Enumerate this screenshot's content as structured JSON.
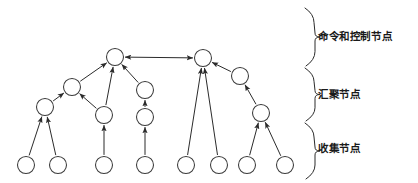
{
  "figure": {
    "title": "",
    "background_color": "#ffffff",
    "stroke_color": "#2b2b2b",
    "node_fill": "#ffffff",
    "width": 418,
    "height": 183
  },
  "tiers": [
    {
      "id": "command-control",
      "label": "命令和控制节点",
      "brace_top": 8,
      "brace_bottom": 66
    },
    {
      "id": "aggregation",
      "label": "汇聚节点",
      "brace_top": 68,
      "brace_bottom": 121
    },
    {
      "id": "collection",
      "label": "收集节点",
      "brace_top": 123,
      "brace_bottom": 179
    }
  ],
  "graph": {
    "node_radius": 8.5,
    "nodes": [
      {
        "id": "c1",
        "tier": "command-control",
        "x": 115,
        "y": 57
      },
      {
        "id": "c2",
        "tier": "command-control",
        "x": 203,
        "y": 58
      },
      {
        "id": "a1",
        "tier": "aggregation",
        "x": 72,
        "y": 87
      },
      {
        "id": "a2",
        "tier": "aggregation",
        "x": 145,
        "y": 90
      },
      {
        "id": "a3",
        "tier": "aggregation",
        "x": 240,
        "y": 76
      },
      {
        "id": "a4",
        "tier": "aggregation",
        "x": 45,
        "y": 107
      },
      {
        "id": "a5",
        "tier": "aggregation",
        "x": 104,
        "y": 115
      },
      {
        "id": "a6",
        "tier": "aggregation",
        "x": 145,
        "y": 117
      },
      {
        "id": "a7",
        "tier": "aggregation",
        "x": 261,
        "y": 113
      },
      {
        "id": "s1",
        "tier": "collection",
        "x": 26,
        "y": 165
      },
      {
        "id": "s2",
        "tier": "collection",
        "x": 58,
        "y": 165
      },
      {
        "id": "s3",
        "tier": "collection",
        "x": 104,
        "y": 165
      },
      {
        "id": "s4",
        "tier": "collection",
        "x": 145,
        "y": 165
      },
      {
        "id": "s5",
        "tier": "collection",
        "x": 186,
        "y": 165
      },
      {
        "id": "s6",
        "tier": "collection",
        "x": 219,
        "y": 165
      },
      {
        "id": "s7",
        "tier": "collection",
        "x": 247,
        "y": 165
      },
      {
        "id": "s8",
        "tier": "collection",
        "x": 285,
        "y": 165
      }
    ],
    "edges": [
      {
        "from": "c1",
        "to": "c2",
        "direction": "bidirectional"
      },
      {
        "from": "a1",
        "to": "c1",
        "direction": "forward"
      },
      {
        "from": "a5",
        "to": "c1",
        "direction": "forward"
      },
      {
        "from": "a2",
        "to": "c1",
        "direction": "forward"
      },
      {
        "from": "a4",
        "to": "a1",
        "direction": "forward"
      },
      {
        "from": "a5",
        "to": "a1",
        "direction": "forward"
      },
      {
        "from": "s1",
        "to": "a4",
        "direction": "forward"
      },
      {
        "from": "s2",
        "to": "a4",
        "direction": "forward"
      },
      {
        "from": "s3",
        "to": "a5",
        "direction": "forward"
      },
      {
        "from": "a6",
        "to": "a2",
        "direction": "forward"
      },
      {
        "from": "s4",
        "to": "a6",
        "direction": "forward"
      },
      {
        "from": "s5",
        "to": "c2",
        "direction": "forward"
      },
      {
        "from": "s6",
        "to": "c2",
        "direction": "forward"
      },
      {
        "from": "a3",
        "to": "c2",
        "direction": "forward"
      },
      {
        "from": "a7",
        "to": "a3",
        "direction": "forward"
      },
      {
        "from": "s7",
        "to": "a7",
        "direction": "forward"
      },
      {
        "from": "s8",
        "to": "a7",
        "direction": "forward"
      }
    ]
  }
}
